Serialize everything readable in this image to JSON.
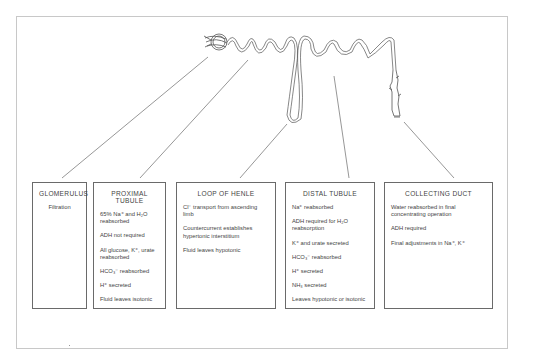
{
  "diagram": {
    "boxes": [
      {
        "id": "glomerulus",
        "title": "GLOMERULUS",
        "items": [
          "Filtration"
        ]
      },
      {
        "id": "proximal-tubule",
        "title": "PROXIMAL TUBULE",
        "items": [
          "65% Na⁺ and H₂O reabsorbed",
          "ADH not required",
          "All glucose, K⁺, urate reabsorbed",
          "HCO₃⁻ reabsorbed",
          "H⁺ secreted",
          "Fluid leaves isotonic"
        ]
      },
      {
        "id": "loop-of-henle",
        "title": "LOOP OF HENLE",
        "items": [
          "Cl⁻ transport from ascending limb",
          "Countercurrent establishes hypertonic interstitium",
          "Fluid leaves hypotonic"
        ]
      },
      {
        "id": "distal-tubule",
        "title": "DISTAL TUBULE",
        "items": [
          "Na⁺ reabsorbed",
          "ADH required for H₂O reabsorption",
          "K⁺ and urate secreted",
          "HCO₃⁻ reabsorbed",
          "H⁺ secreted",
          "NH₃ secreted",
          "Leaves hypotonic or isotonic"
        ]
      },
      {
        "id": "collecting-duct",
        "title": "COLLECTING DUCT",
        "items": [
          "Water reabsorbed in final concentrating operation",
          "ADH required",
          "Final adjustments in Na⁺, K⁺"
        ]
      }
    ]
  },
  "colors": {
    "line": "#6a6a6a",
    "frame": "#c8c8c8",
    "text": "#444444"
  }
}
